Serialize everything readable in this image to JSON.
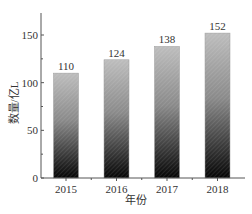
{
  "chart_data": {
    "type": "bar",
    "title": "",
    "xlabel": "年份",
    "ylabel": "数量/亿L",
    "categories": [
      "2015",
      "2016",
      "2017",
      "2018"
    ],
    "values": [
      110,
      124,
      138,
      152
    ],
    "data_labels": [
      "110",
      "124",
      "138",
      "152"
    ],
    "ylim": [
      0,
      175
    ],
    "yticks": [
      0,
      50,
      100,
      150
    ],
    "ytick_labels": [
      "0",
      "50",
      "100",
      "150"
    ],
    "grid": false,
    "legend": null,
    "bar_fill": "vertical gradient black (bottom) to gray hatched (top)"
  },
  "colors": {
    "axis": "#555555",
    "bar_top": "#b8b8b8",
    "bar_bottom": "#050505"
  }
}
